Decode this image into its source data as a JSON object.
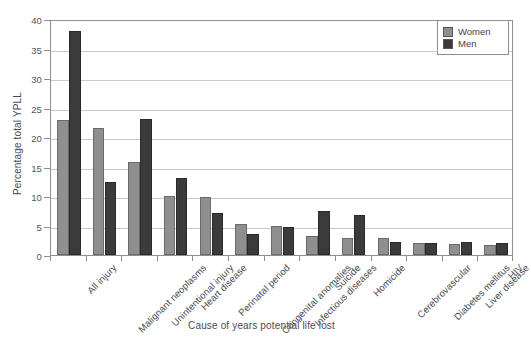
{
  "figure": {
    "cut_off_caption": "",
    "axis_line_color": "#8f8f8f",
    "grid_color": "#c9c9c9"
  },
  "legend": {
    "position": "top-right",
    "entries": [
      {
        "label": "Women",
        "color": "#8f8f8f"
      },
      {
        "label": "Men",
        "color": "#3b3b3b"
      }
    ]
  },
  "chart_data": {
    "type": "bar",
    "title": "",
    "xlabel": "Cause of years potential life lost",
    "ylabel": "Percentage total YPLL",
    "ylim": [
      0,
      40
    ],
    "yticks": [
      0,
      5,
      10,
      15,
      20,
      25,
      30,
      35,
      40
    ],
    "grid": true,
    "legend_position": "top-right",
    "categories": [
      "All injury",
      "Malignant neoplasms",
      "Unintentional injury",
      "Heart disease",
      "Perinatal period",
      "Congenital anomalies",
      "Infectious diseases",
      "Suicide",
      "Homicide",
      "Cerebrovascular",
      "Diabetes mellitus",
      "Liver disease",
      "HIV"
    ],
    "series": [
      {
        "name": "Women",
        "color": "#8f8f8f",
        "values": [
          22.8,
          21.5,
          15.8,
          10.0,
          9.8,
          5.2,
          5.0,
          3.3,
          2.9,
          2.8,
          2.1,
          1.8,
          1.7
        ]
      },
      {
        "name": "Men",
        "color": "#3b3b3b",
        "values": [
          38.0,
          12.4,
          23.0,
          13.0,
          7.2,
          3.6,
          4.8,
          7.5,
          6.8,
          2.2,
          2.1,
          2.2,
          2.1
        ]
      }
    ]
  }
}
